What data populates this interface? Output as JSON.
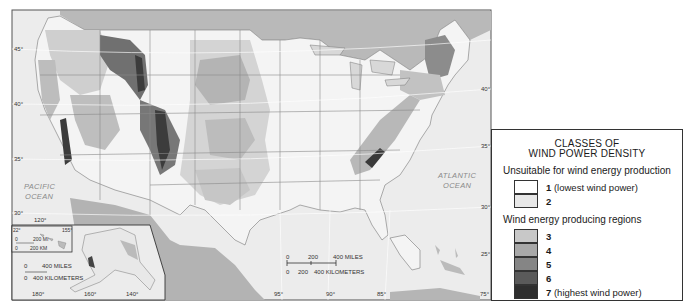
{
  "map": {
    "ocean_labels": {
      "pacific_line1": "PACIFIC",
      "pacific_line2": "OCEAN",
      "atlantic_line1": "ATLANTIC",
      "atlantic_line2": "OCEAN"
    },
    "latitude_labels_left": [
      "45°",
      "40°",
      "35°",
      "30°"
    ],
    "latitude_labels_right": [
      "40°",
      "35°",
      "30°",
      "25°"
    ],
    "longitude_labels_bottom": [
      "95°",
      "90°",
      "85°",
      "75°"
    ],
    "scale_bar": {
      "miles_ticks": [
        "0",
        "200",
        "400 MILES"
      ],
      "km_ticks": [
        "0",
        "200",
        "400 KILOMETERS"
      ]
    },
    "alaska_inset": {
      "longitude_labels": [
        "180°",
        "160°",
        "140°"
      ],
      "top_label": "120°",
      "scale_miles": "400 MILES",
      "scale_km": "400 KILOMETERS",
      "scale_zero": "0"
    },
    "hawaii_inset": {
      "lat_label": "22°",
      "lon_label": "155°",
      "zero": "0",
      "scale_mi": "200 MI",
      "scale_km": "200 KM"
    }
  },
  "legend": {
    "title_line1": "CLASSES OF",
    "title_line2": "WIND POWER DENSITY",
    "group_unsuitable": "Unsuitable for wind energy production",
    "group_producing": "Wind energy producing regions",
    "classes": [
      {
        "num": "1",
        "desc": "(lowest wind power)",
        "color": "#ffffff"
      },
      {
        "num": "2",
        "desc": "",
        "color": "#e8e8e8"
      },
      {
        "num": "3",
        "desc": "",
        "color": "#c8c8c8"
      },
      {
        "num": "4",
        "desc": "",
        "color": "#a8a8a8"
      },
      {
        "num": "5",
        "desc": "",
        "color": "#858585"
      },
      {
        "num": "6",
        "desc": "",
        "color": "#5a5a5a"
      },
      {
        "num": "7",
        "desc": "(highest wind power)",
        "color": "#2e2e2e"
      }
    ]
  }
}
